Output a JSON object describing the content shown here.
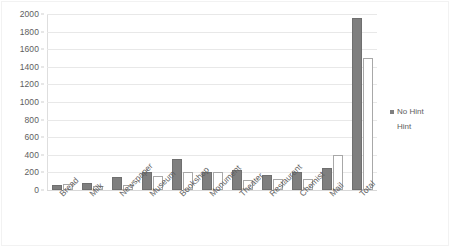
{
  "chart_data": {
    "type": "bar",
    "title": "",
    "subtitle": "",
    "xlabel": "",
    "ylabel": "",
    "ylim": [
      0,
      2000
    ],
    "ytick_step": 200,
    "yticks": [
      0,
      200,
      400,
      600,
      800,
      1000,
      1200,
      1400,
      1600,
      1800,
      2000
    ],
    "ytick_labels": [
      "0",
      "200",
      "400",
      "600",
      "800",
      "1000",
      "1200",
      "1400",
      "1600",
      "1800",
      "2000"
    ],
    "grid": true,
    "grid_axis": "y",
    "legend_position": "right",
    "categories": [
      "Bread",
      "Milk",
      "Newspaper",
      "Museum",
      "Bookshop",
      "Monument",
      "Theater",
      "Restaurant",
      "Chemist",
      "Mail",
      "Total"
    ],
    "series": [
      {
        "name": "No Hint",
        "color": "#7f7f7f",
        "values": [
          60,
          80,
          150,
          200,
          350,
          200,
          230,
          170,
          200,
          250,
          1950
        ]
      },
      {
        "name": "Hint",
        "color": "#ffffff",
        "values": [
          70,
          40,
          60,
          160,
          200,
          200,
          110,
          130,
          120,
          400,
          1500
        ]
      }
    ]
  },
  "legend": {
    "entries": [
      {
        "label": "No Hint",
        "swatch": "filled"
      },
      {
        "label": "Hint",
        "swatch": "hollow"
      }
    ]
  },
  "colors": {
    "series_no_hint": "#7f7f7f",
    "series_hint": "#ffffff",
    "series_hint_outline": "#a8a8a8",
    "gridline": "#e8e8e8",
    "axis": "#d8d8d8",
    "text": "#5e5e5e",
    "background": "#ffffff"
  }
}
